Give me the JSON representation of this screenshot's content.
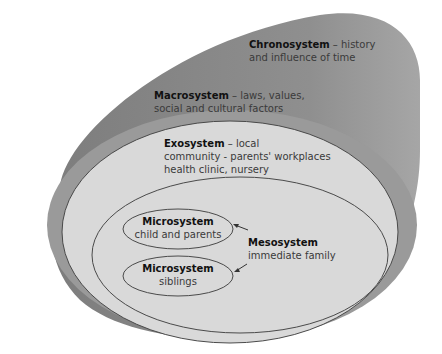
{
  "diagram": {
    "colors": {
      "chronosystem": "#8e8e8e",
      "macrosystem": "#9c9c9c",
      "exosystem": "#d8d8d8",
      "outline": "#4a4a4a",
      "background": "#ffffff"
    },
    "chronosystem": {
      "title": "Chronosystem",
      "desc_line1": " – history",
      "desc_line2": "and influence of time"
    },
    "macrosystem": {
      "title": "Macrosystem",
      "desc_line1": " – laws, values,",
      "desc_line2": "social and cultural factors"
    },
    "exosystem": {
      "title": "Exosystem",
      "desc_line1": " – local",
      "desc_line2": "community - parents' workplaces",
      "desc_line3": "health clinic, nursery"
    },
    "mesosystem": {
      "title": "Mesosystem",
      "desc": "immediate family"
    },
    "microsystems": [
      {
        "title": "Microsystem",
        "desc": "child and parents"
      },
      {
        "title": "Microsystem",
        "desc": "siblings"
      }
    ]
  }
}
